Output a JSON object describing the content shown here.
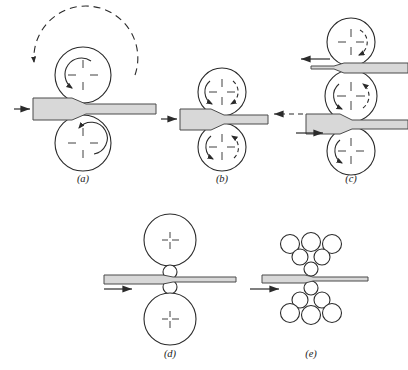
{
  "figure": {
    "background_color": "#ffffff",
    "line_color": "#2b2b2b",
    "slab_fill_color": "#d8d8d8",
    "slab_stroke_color": "#4a4a4a",
    "roll_fill_color": "#ffffff"
  },
  "panels": [
    {
      "id": "a",
      "label": "(a)",
      "name": "two-high-mill-non-reversing",
      "rolls": [
        {
          "name": "top-roll",
          "cx": 83,
          "cy": 75,
          "r": 28,
          "rotation": "clockwise",
          "arc_style": "solid"
        },
        {
          "name": "bottom-roll",
          "cx": 83,
          "cy": 143,
          "r": 28,
          "rotation": "counter-clockwise",
          "arc_style": "solid"
        }
      ],
      "outer_arc": {
        "name": "large-dashed-arc",
        "cx": 83,
        "cy": 75,
        "r": 52,
        "direction": "counter-clockwise",
        "style": "dashed"
      },
      "workpieces": [
        {
          "name": "slab",
          "x_left": 33,
          "x_right": 156,
          "entry_thickness": 22,
          "exit_thickness": 11,
          "center_y": 109
        }
      ],
      "arrows": [
        {
          "name": "entry-arrow",
          "direction": "right",
          "style": "solid",
          "x1": 14,
          "y1": 109,
          "x2": 32,
          "y2": 109
        }
      ]
    },
    {
      "id": "b",
      "label": "(b)",
      "name": "two-high-mill-reversing",
      "rolls": [
        {
          "name": "top-roll",
          "cx": 222,
          "cy": 92,
          "r": 24,
          "rotation": "clockwise",
          "arc_style": "solid-and-dashed"
        },
        {
          "name": "bottom-roll",
          "cx": 222,
          "cy": 147,
          "r": 24,
          "rotation": "counter-clockwise",
          "arc_style": "solid-and-dashed"
        }
      ],
      "workpieces": [
        {
          "name": "slab",
          "x_left": 180,
          "x_right": 268,
          "entry_thickness": 20,
          "exit_thickness": 10,
          "center_y": 119
        }
      ],
      "arrows": [
        {
          "name": "entry-arrow",
          "direction": "right",
          "style": "solid",
          "x1": 161,
          "y1": 119,
          "x2": 179,
          "y2": 119
        },
        {
          "name": "reverse-arrow",
          "direction": "left",
          "style": "dashed",
          "x1": 303,
          "y1": 114,
          "x2": 272,
          "y2": 114
        }
      ]
    },
    {
      "id": "c",
      "label": "(c)",
      "name": "three-high-mill",
      "rolls": [
        {
          "name": "top-roll",
          "cx": 351,
          "cy": 42,
          "r": 24,
          "rotation": "clockwise",
          "arc_style": "dashed"
        },
        {
          "name": "middle-roll",
          "cx": 351,
          "cy": 96,
          "r": 26,
          "rotation": "counter-clockwise",
          "arc_style": "solid-and-dashed"
        },
        {
          "name": "bottom-roll",
          "cx": 351,
          "cy": 151,
          "r": 24,
          "rotation": "counter-clockwise",
          "arc_style": "solid"
        }
      ],
      "workpieces": [
        {
          "name": "upper-slab",
          "x_left": 311,
          "x_right": 404,
          "entry_thickness": 9,
          "exit_thickness": 9,
          "center_y": 68
        },
        {
          "name": "lower-slab",
          "x_left": 306,
          "x_right": 404,
          "entry_thickness": 18,
          "exit_thickness": 9,
          "center_y": 124
        }
      ],
      "arrows": [
        {
          "name": "upper-exit-arrow",
          "direction": "left",
          "style": "solid",
          "x1": 330,
          "y1": 60,
          "x2": 299,
          "y2": 60
        },
        {
          "name": "lower-entry-arrow",
          "direction": "right",
          "style": "solid",
          "x1": 296,
          "y1": 133,
          "x2": 325,
          "y2": 133
        }
      ]
    },
    {
      "id": "d",
      "label": "(d)",
      "name": "four-high-mill",
      "rolls": [
        {
          "name": "top-backup-roll",
          "cx": 170,
          "cy": 240,
          "r": 26,
          "rotation": "none",
          "arc_style": "none"
        },
        {
          "name": "top-work-roll",
          "cx": 170,
          "cy": 272,
          "r": 7,
          "rotation": "none",
          "arc_style": "none"
        },
        {
          "name": "bottom-work-roll",
          "cx": 170,
          "cy": 287,
          "r": 7,
          "rotation": "none",
          "arc_style": "none"
        },
        {
          "name": "bottom-backup-roll",
          "cx": 170,
          "cy": 319,
          "r": 26,
          "rotation": "none",
          "arc_style": "none"
        }
      ],
      "workpieces": [
        {
          "name": "strip",
          "x_left": 104,
          "x_right": 236,
          "entry_thickness": 7,
          "exit_thickness": 5,
          "center_y": 280
        }
      ],
      "arrows": [
        {
          "name": "entry-arrow",
          "direction": "right",
          "style": "solid",
          "x1": 104,
          "y1": 289,
          "x2": 134,
          "y2": 289
        }
      ]
    },
    {
      "id": "e",
      "label": "(e)",
      "name": "cluster-mill",
      "rolls": [
        {
          "name": "top-work-roll",
          "cx": 311,
          "cy": 270,
          "r": 7,
          "rotation": "none",
          "arc_style": "none"
        },
        {
          "name": "top-intermediate-roll-left",
          "cx": 300,
          "cy": 256,
          "r": 8,
          "rotation": "none",
          "arc_style": "none"
        },
        {
          "name": "top-intermediate-roll-right",
          "cx": 322,
          "cy": 256,
          "r": 8,
          "rotation": "none",
          "arc_style": "none"
        },
        {
          "name": "top-backup-roll-left",
          "cx": 290,
          "cy": 244,
          "r": 9,
          "rotation": "none",
          "arc_style": "none"
        },
        {
          "name": "top-backup-roll-center",
          "cx": 311,
          "cy": 243,
          "r": 9,
          "rotation": "none",
          "arc_style": "none"
        },
        {
          "name": "top-backup-roll-right",
          "cx": 331,
          "cy": 244,
          "r": 9,
          "rotation": "none",
          "arc_style": "none"
        },
        {
          "name": "bottom-work-roll",
          "cx": 311,
          "cy": 288,
          "r": 7,
          "rotation": "none",
          "arc_style": "none"
        },
        {
          "name": "bottom-intermediate-roll-left",
          "cx": 300,
          "cy": 301,
          "r": 8,
          "rotation": "none",
          "arc_style": "none"
        },
        {
          "name": "bottom-intermediate-roll-right",
          "cx": 322,
          "cy": 301,
          "r": 8,
          "rotation": "none",
          "arc_style": "none"
        },
        {
          "name": "bottom-backup-roll-left",
          "cx": 290,
          "cy": 314,
          "r": 9,
          "rotation": "none",
          "arc_style": "none"
        },
        {
          "name": "bottom-backup-roll-center",
          "cx": 311,
          "cy": 315,
          "r": 9,
          "rotation": "none",
          "arc_style": "none"
        },
        {
          "name": "bottom-backup-roll-right",
          "cx": 331,
          "cy": 314,
          "r": 9,
          "rotation": "none",
          "arc_style": "none"
        }
      ],
      "workpieces": [
        {
          "name": "strip",
          "x_left": 262,
          "x_right": 368,
          "entry_thickness": 6,
          "exit_thickness": 4,
          "center_y": 279
        }
      ],
      "arrows": [
        {
          "name": "entry-arrow",
          "direction": "right",
          "style": "solid",
          "x1": 250,
          "y1": 289,
          "x2": 281,
          "y2": 289
        }
      ]
    }
  ],
  "labels": {
    "a": "(a)",
    "b": "(b)",
    "c": "(c)",
    "d": "(d)",
    "e": "(e)"
  },
  "label_positions": {
    "a": {
      "x": 83,
      "y": 182
    },
    "b": {
      "x": 222,
      "y": 182
    },
    "c": {
      "x": 351,
      "y": 182
    },
    "d": {
      "x": 170,
      "y": 357
    },
    "e": {
      "x": 311,
      "y": 357
    }
  }
}
